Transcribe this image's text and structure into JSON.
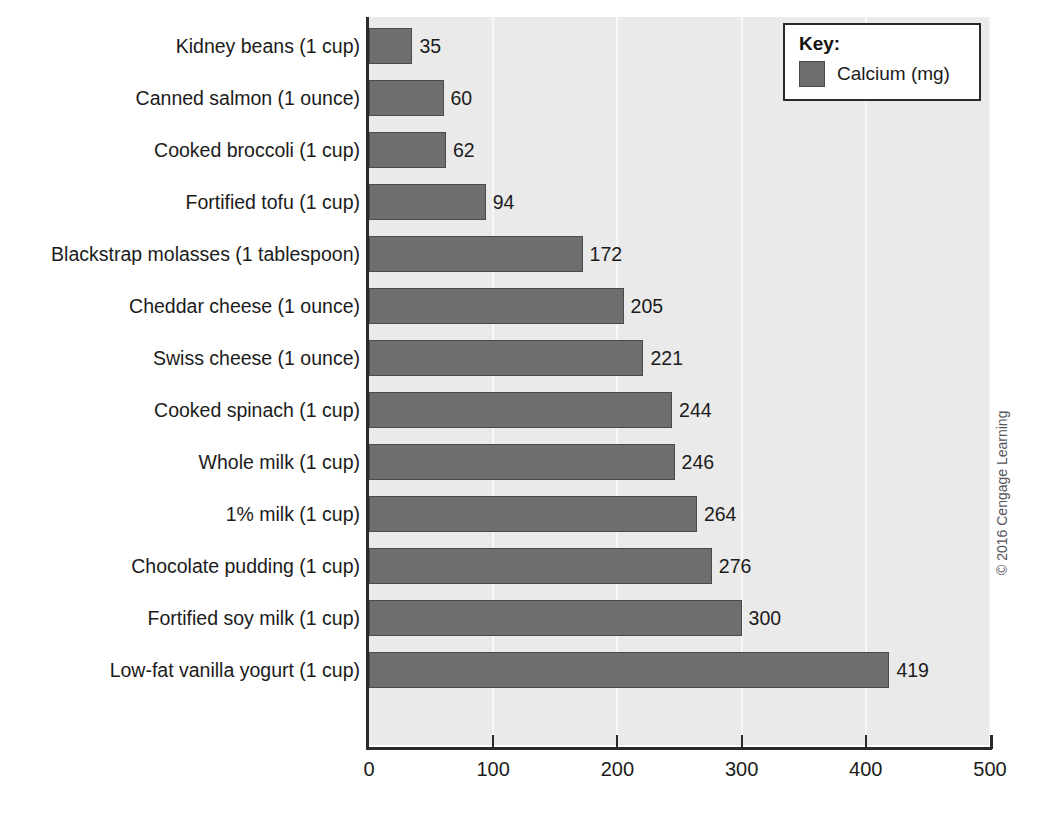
{
  "chart_data": {
    "type": "bar",
    "orientation": "horizontal",
    "title": "",
    "xlabel": "",
    "ylabel": "",
    "xlim": [
      0,
      500
    ],
    "xticks": [
      0,
      100,
      200,
      300,
      400,
      500
    ],
    "xticklabels": [
      "0",
      "100",
      "200",
      "300",
      "400",
      "500"
    ],
    "grid": true,
    "grid_axis": "x",
    "legend_position": "top-right",
    "categories": [
      "Kidney beans (1 cup)",
      "Canned salmon (1 ounce)",
      "Cooked broccoli (1 cup)",
      "Fortified tofu (1 cup)",
      "Blackstrap molasses (1 tablespoon)",
      "Cheddar cheese (1 ounce)",
      "Swiss cheese (1 ounce)",
      "Cooked spinach (1 cup)",
      "Whole milk (1 cup)",
      "1% milk (1 cup)",
      "Chocolate pudding (1 cup)",
      "Fortified soy milk (1 cup)",
      "Low-fat vanilla yogurt (1 cup)"
    ],
    "series": [
      {
        "name": "Calcium (mg)",
        "values": [
          35,
          60,
          62,
          94,
          172,
          205,
          221,
          244,
          246,
          264,
          276,
          300,
          419
        ],
        "color": "#6e6e6e"
      }
    ],
    "value_labels": [
      "35",
      "60",
      "62",
      "94",
      "172",
      "205",
      "221",
      "244",
      "246",
      "264",
      "276",
      "300",
      "419"
    ]
  },
  "legend": {
    "title": "Key:",
    "entries": [
      {
        "label": "Calcium (mg)",
        "color": "#6e6e6e"
      }
    ]
  },
  "credit": {
    "text": "© 2016 Cengage Learning"
  },
  "colors": {
    "plot_background": "#eaeaea",
    "gridline": "#f8f8f8",
    "axis": "#2a2a2a",
    "bar_fill": "#6e6e6e",
    "bar_stroke": "#4a4a4a",
    "text": "#1b1b1b"
  }
}
